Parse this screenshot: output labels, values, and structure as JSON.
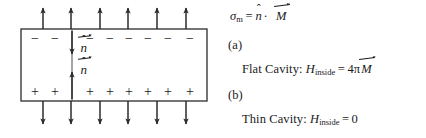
{
  "figure": {
    "colors": {
      "stroke": "#1a1a1a",
      "arrow": "#2b2b2b",
      "background": "#ffffff",
      "box_border": "#3a3a3a"
    }
  },
  "diagram": {
    "name": "magnetized-slab-diagram",
    "box": {
      "x": 21,
      "y": 29,
      "width": 186,
      "height": 72
    },
    "divider_x": 72,
    "top_arrows": {
      "direction": "up",
      "count": 6,
      "x_positions": [
        43,
        71,
        100,
        128,
        157,
        186
      ],
      "y_start": 29,
      "y_end": 6
    },
    "bottom_arrows": {
      "direction": "down",
      "count": 6,
      "x_positions": [
        43,
        71,
        100,
        128,
        157,
        186
      ],
      "y_start": 101,
      "y_end": 126
    },
    "negative_charges": {
      "symbol": "−",
      "count": 8,
      "x_positions": [
        35,
        54,
        90,
        110,
        129,
        148,
        167,
        189
      ],
      "y": 38
    },
    "positive_charges": {
      "symbol": "+",
      "count": 8,
      "x_positions": [
        35,
        54,
        90,
        110,
        129,
        148,
        167,
        189
      ],
      "y": 92
    },
    "normal_upper": {
      "label": "n",
      "accent": "hat-and-vector-arrow",
      "direction": "down",
      "arrow_x": 72,
      "arrow_y_start": 31,
      "arrow_y_end": 53,
      "label_x": 78,
      "label_y": 48
    },
    "normal_lower": {
      "label": "n",
      "accent": "hat-and-vector-arrow",
      "direction": "up",
      "arrow_x": 72,
      "arrow_y_start": 99,
      "arrow_y_end": 73,
      "label_x": 78,
      "label_y": 70
    }
  },
  "equations": {
    "surface_charge": {
      "lhs_symbol": "σ",
      "lhs_sub": "m",
      "equals": "=",
      "normal_symbol": "n",
      "dot": "·",
      "magnetization_symbol": "M"
    },
    "item_a": {
      "marker": "(a)",
      "text_prefix": "Flat Cavity:",
      "field_symbol": "H",
      "field_sub": "inside",
      "equals": "=",
      "coefficient": "4π",
      "magnetization_symbol": "M"
    },
    "item_b": {
      "marker": "(b)",
      "text_prefix": "Thin Cavity:",
      "field_symbol": "H",
      "field_sub": "inside",
      "equals": "=",
      "value": "0"
    }
  }
}
